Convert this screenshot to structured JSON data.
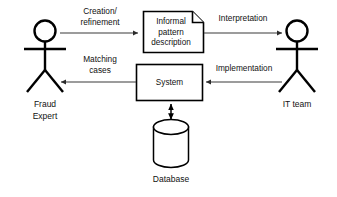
{
  "diagram": {
    "type": "process-flow",
    "background_color": "#ffffff",
    "stroke_color": "#000000",
    "edge_color": "#3a3a3a",
    "nodes": {
      "fraud_expert": {
        "label_line1": "Fraud",
        "label_line2": "Expert",
        "shape": "actor-stick-figure"
      },
      "it_team": {
        "label_line1": "IT team",
        "shape": "actor-stick-figure"
      },
      "document": {
        "label_line1": "Informal",
        "label_line2": "pattern",
        "label_line3": "description",
        "shape": "document-folded-corner"
      },
      "system": {
        "label_line1": "System",
        "shape": "rectangle"
      },
      "database": {
        "label_line1": "Database",
        "shape": "cylinder"
      }
    },
    "edges": {
      "creation": {
        "label_line1": "Creation/",
        "label_line2": "refinement",
        "direction": "right"
      },
      "interpretation": {
        "label_line1": "Interpretation",
        "direction": "right"
      },
      "implementation": {
        "label_line1": "Implementation",
        "direction": "left"
      },
      "matching": {
        "label_line1": "Matching",
        "label_line2": "cases",
        "direction": "left"
      },
      "db_link": {
        "label_line1": "",
        "direction": "bidirectional"
      }
    }
  }
}
